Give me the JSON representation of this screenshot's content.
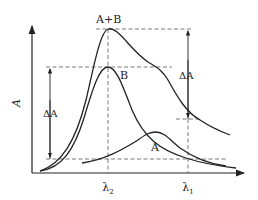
{
  "diagram": {
    "type": "absorption-spectrum-overlap",
    "axes": {
      "y_label": "A",
      "x_ticks": [
        {
          "label": "λ₂",
          "base": "λ",
          "sub": "2"
        },
        {
          "label": "λ₁",
          "base": "λ",
          "sub": "1"
        }
      ]
    },
    "curves": [
      {
        "name": "A+B",
        "label": "A+B",
        "peak_at": "λ₂"
      },
      {
        "name": "B",
        "label": "B",
        "peak_at": "λ₂"
      },
      {
        "name": "A",
        "label": "A",
        "peak_at": "between λ₂ and λ₁"
      }
    ],
    "annotations": {
      "delta_left": "ΔA",
      "delta_right": "ΔA"
    },
    "colors": {
      "line": "#222222",
      "dashed": "#555555",
      "background": "#ffffff"
    }
  }
}
